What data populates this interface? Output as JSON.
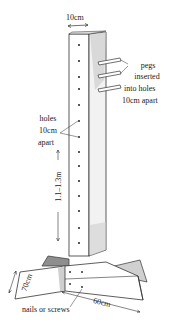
{
  "diagram": {
    "labels": {
      "top_width": "10cm",
      "pegs_line1": "pegs",
      "pegs_line2": "inserted",
      "pegs_line3": "into holes",
      "pegs_line4": "10cm apart",
      "holes_line1": "holes",
      "holes_line2": "10cm",
      "holes_line3": "apart",
      "height": "1.1–1.3m",
      "base_depth": "70cm",
      "base_length": "60cm",
      "fasteners": "nails or screws"
    },
    "colors": {
      "ink": "#222222",
      "shade": "#9a9a9a",
      "background": "#ffffff"
    }
  }
}
